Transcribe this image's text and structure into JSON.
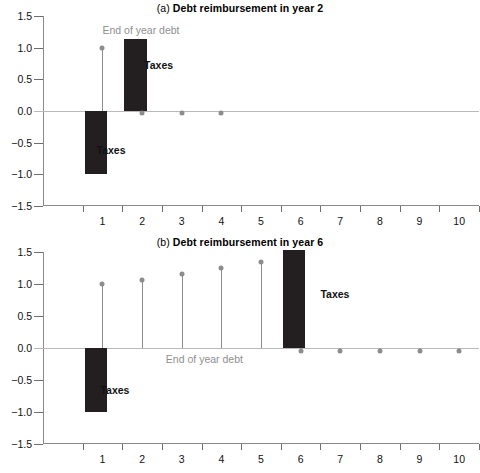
{
  "figure": {
    "background": "#ffffff",
    "bar_color": "#231f20",
    "stem_color": "#8d8d8d",
    "axis_color": "#8a8a8a",
    "note_color": "#8f8f8f"
  },
  "panels": [
    {
      "id": "a",
      "tag": "(a)",
      "title": "Debt reimbursement in year 2",
      "full_title": "(a) Debt reimbursement in year 2",
      "note": "End of year debt",
      "taxes_label_negative": "Taxes",
      "taxes_label_positive": "Taxes"
    },
    {
      "id": "b",
      "tag": "(b)",
      "title": "Debt reimbursement in year 6",
      "full_title": "(b) Debt reimbursement in year 6",
      "note": "End of year debt",
      "taxes_label_negative": "Taxes",
      "taxes_label_positive": "Taxes"
    }
  ],
  "axis": {
    "y_ticks": [
      "1.5",
      "1.0",
      "0.5",
      "0.0",
      "-0.5",
      "-1.0",
      "-1.5"
    ],
    "y_values": [
      1.5,
      1.0,
      0.5,
      0.0,
      -0.5,
      -1.0,
      -1.5
    ],
    "x_ticks": [
      "1",
      "2",
      "3",
      "4",
      "5",
      "6",
      "7",
      "8",
      "9",
      "10"
    ],
    "ylim": [
      -1.5,
      1.5
    ],
    "xlim": [
      0,
      11
    ]
  },
  "chart_data": [
    {
      "type": "bar",
      "id": "panel-a",
      "title": "(a) Debt reimbursement in year 2",
      "xlabel": "",
      "ylabel": "",
      "ylim": [
        -1.5,
        1.5
      ],
      "xlim": [
        0,
        11
      ],
      "grid": false,
      "legend": "none",
      "categories": [
        1,
        2,
        3,
        4,
        5,
        6,
        7,
        8,
        9,
        10
      ],
      "series": [
        {
          "name": "Taxes",
          "kind": "bar",
          "color": "#231f20",
          "values": [
            -1.0,
            1.13,
            0,
            0,
            0,
            0,
            0,
            0,
            0,
            0
          ]
        },
        {
          "name": "End of year debt",
          "kind": "stem",
          "color": "#8d8d8d",
          "x": [
            1.5,
            2.5,
            3.5,
            4.5
          ],
          "values": [
            1.0,
            -0.03,
            -0.03,
            -0.03
          ]
        }
      ],
      "annotations": [
        {
          "text": "End of year debt",
          "x": 1.5,
          "y": 1.28,
          "color": "#8f8f8f",
          "bold": false
        },
        {
          "text": "Taxes",
          "x": 2.55,
          "y": 0.72,
          "color": "#111111",
          "bold": true
        },
        {
          "text": "Taxes",
          "x": 1.35,
          "y": -0.62,
          "color": "#111111",
          "bold": true
        }
      ]
    },
    {
      "type": "bar",
      "id": "panel-b",
      "title": "(b) Debt reimbursement in year 6",
      "xlabel": "",
      "ylabel": "",
      "ylim": [
        -1.5,
        1.5
      ],
      "xlim": [
        0,
        11
      ],
      "grid": false,
      "legend": "none",
      "categories": [
        1,
        2,
        3,
        4,
        5,
        6,
        7,
        8,
        9,
        10
      ],
      "series": [
        {
          "name": "Taxes",
          "kind": "bar",
          "color": "#231f20",
          "values": [
            -1.0,
            0,
            0,
            0,
            0,
            1.53,
            0,
            0,
            0,
            0
          ]
        },
        {
          "name": "End of year debt",
          "kind": "stem",
          "color": "#8d8d8d",
          "x": [
            1.5,
            2.5,
            3.5,
            4.5,
            5.5,
            6.5,
            7.5,
            8.5,
            9.5,
            10.5
          ],
          "values": [
            1.0,
            1.07,
            1.16,
            1.25,
            1.35,
            -0.05,
            -0.05,
            -0.05,
            -0.05,
            -0.05
          ]
        }
      ],
      "annotations": [
        {
          "text": "End of year debt",
          "x": 3.1,
          "y": -0.17,
          "color": "#8f8f8f",
          "bold": false
        },
        {
          "text": "Taxes",
          "x": 7.0,
          "y": 0.85,
          "color": "#111111",
          "bold": true
        },
        {
          "text": "Taxes",
          "x": 1.45,
          "y": -0.66,
          "color": "#111111",
          "bold": true
        }
      ]
    }
  ]
}
